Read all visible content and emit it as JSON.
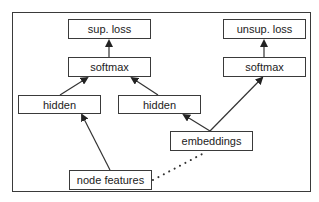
{
  "diagram": {
    "nodes": [
      {
        "id": "sup_loss",
        "label": "sup. loss"
      },
      {
        "id": "softmax_left",
        "label": "softmax"
      },
      {
        "id": "hidden_left",
        "label": "hidden"
      },
      {
        "id": "hidden_mid",
        "label": "hidden"
      },
      {
        "id": "unsup_loss",
        "label": "unsup. loss"
      },
      {
        "id": "softmax_right",
        "label": "softmax"
      },
      {
        "id": "embeddings",
        "label": "embeddings"
      },
      {
        "id": "node_features",
        "label": "node features"
      }
    ],
    "edges": [
      {
        "from": "softmax_left",
        "to": "sup_loss",
        "style": "solid-arrow"
      },
      {
        "from": "hidden_left",
        "to": "softmax_left",
        "style": "solid-arrow"
      },
      {
        "from": "hidden_mid",
        "to": "softmax_left",
        "style": "solid-arrow"
      },
      {
        "from": "node_features",
        "to": "hidden_left",
        "style": "solid-arrow"
      },
      {
        "from": "embeddings",
        "to": "hidden_mid",
        "style": "solid-arrow"
      },
      {
        "from": "embeddings",
        "to": "softmax_right",
        "style": "solid-arrow"
      },
      {
        "from": "softmax_right",
        "to": "unsup_loss",
        "style": "solid-arrow"
      },
      {
        "from": "node_features",
        "to": "embeddings",
        "style": "dotted"
      }
    ]
  }
}
